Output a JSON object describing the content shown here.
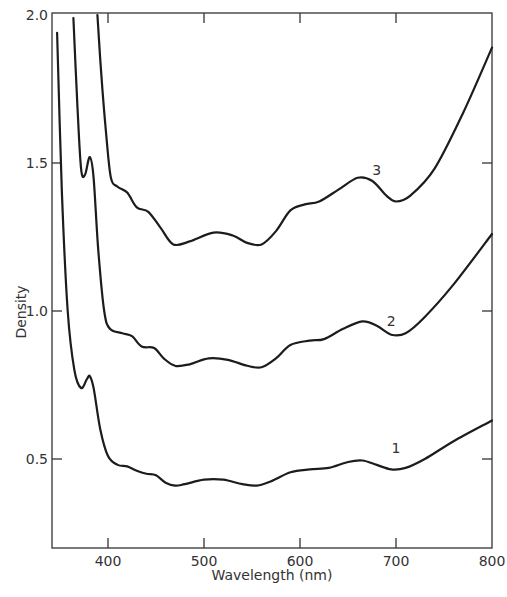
{
  "chart_data": {
    "type": "line",
    "title": "",
    "xlabel": "Wavelength (nm)",
    "ylabel": "Density",
    "xlim": [
      347,
      800
    ],
    "ylim": [
      0.27,
      2.0
    ],
    "grid": false,
    "legend": "none (curves labeled inline 1, 2, 3)",
    "x_ticks": [
      400,
      500,
      600,
      700,
      800
    ],
    "x_tick_labels": [
      "400",
      "500",
      "600",
      "700",
      "800"
    ],
    "y_ticks": [
      0.5,
      1.0,
      1.5,
      2.0
    ],
    "y_tick_labels": [
      "0.5",
      "1.0",
      "1.5",
      "2.0"
    ],
    "series": [
      {
        "name": "1",
        "label_pos": [
          700,
          0.52
        ],
        "points": [
          [
            347,
            1.94
          ],
          [
            352,
            1.4
          ],
          [
            358,
            1.0
          ],
          [
            365,
            0.8
          ],
          [
            372,
            0.74
          ],
          [
            378,
            0.77
          ],
          [
            381,
            0.78
          ],
          [
            385,
            0.74
          ],
          [
            392,
            0.6
          ],
          [
            400,
            0.51
          ],
          [
            410,
            0.48
          ],
          [
            420,
            0.475
          ],
          [
            430,
            0.46
          ],
          [
            440,
            0.45
          ],
          [
            450,
            0.445
          ],
          [
            460,
            0.42
          ],
          [
            470,
            0.41
          ],
          [
            480,
            0.415
          ],
          [
            500,
            0.43
          ],
          [
            520,
            0.43
          ],
          [
            540,
            0.415
          ],
          [
            555,
            0.41
          ],
          [
            570,
            0.425
          ],
          [
            590,
            0.455
          ],
          [
            610,
            0.465
          ],
          [
            630,
            0.47
          ],
          [
            650,
            0.49
          ],
          [
            665,
            0.495
          ],
          [
            680,
            0.48
          ],
          [
            695,
            0.465
          ],
          [
            710,
            0.47
          ],
          [
            730,
            0.5
          ],
          [
            760,
            0.56
          ],
          [
            800,
            0.63
          ]
        ]
      },
      {
        "name": "2",
        "label_pos": [
          695,
          0.95
        ],
        "points": [
          [
            364,
            1.99
          ],
          [
            368,
            1.7
          ],
          [
            372,
            1.48
          ],
          [
            376,
            1.46
          ],
          [
            381,
            1.52
          ],
          [
            385,
            1.45
          ],
          [
            390,
            1.2
          ],
          [
            396,
            1.0
          ],
          [
            402,
            0.94
          ],
          [
            415,
            0.925
          ],
          [
            425,
            0.915
          ],
          [
            435,
            0.88
          ],
          [
            448,
            0.875
          ],
          [
            458,
            0.84
          ],
          [
            470,
            0.815
          ],
          [
            485,
            0.82
          ],
          [
            505,
            0.84
          ],
          [
            525,
            0.835
          ],
          [
            545,
            0.815
          ],
          [
            560,
            0.81
          ],
          [
            575,
            0.84
          ],
          [
            590,
            0.885
          ],
          [
            610,
            0.9
          ],
          [
            625,
            0.905
          ],
          [
            645,
            0.94
          ],
          [
            665,
            0.965
          ],
          [
            680,
            0.95
          ],
          [
            695,
            0.92
          ],
          [
            710,
            0.925
          ],
          [
            730,
            0.98
          ],
          [
            760,
            1.09
          ],
          [
            800,
            1.26
          ]
        ]
      },
      {
        "name": "3",
        "label_pos": [
          680,
          1.46
        ],
        "points": [
          [
            389,
            2.0
          ],
          [
            393,
            1.8
          ],
          [
            398,
            1.6
          ],
          [
            403,
            1.45
          ],
          [
            410,
            1.42
          ],
          [
            420,
            1.4
          ],
          [
            430,
            1.35
          ],
          [
            442,
            1.335
          ],
          [
            455,
            1.28
          ],
          [
            468,
            1.225
          ],
          [
            485,
            1.235
          ],
          [
            510,
            1.265
          ],
          [
            530,
            1.255
          ],
          [
            545,
            1.23
          ],
          [
            560,
            1.225
          ],
          [
            575,
            1.27
          ],
          [
            590,
            1.34
          ],
          [
            605,
            1.36
          ],
          [
            620,
            1.37
          ],
          [
            640,
            1.41
          ],
          [
            660,
            1.45
          ],
          [
            675,
            1.44
          ],
          [
            690,
            1.39
          ],
          [
            700,
            1.37
          ],
          [
            715,
            1.39
          ],
          [
            740,
            1.48
          ],
          [
            770,
            1.67
          ],
          [
            800,
            1.89
          ]
        ]
      }
    ]
  },
  "axis_labels": {
    "x": "Wavelength (nm)",
    "y": "Density"
  }
}
